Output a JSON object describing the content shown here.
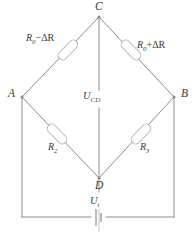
{
  "diagram": {
    "type": "wheatstone-bridge-circuit",
    "nodes": [
      {
        "id": "C",
        "label": "C",
        "position": "top"
      },
      {
        "id": "A",
        "label": "A",
        "position": "left"
      },
      {
        "id": "B",
        "label": "B",
        "position": "right"
      },
      {
        "id": "D",
        "label": "D",
        "position": "bottom"
      }
    ],
    "resistors": [
      {
        "id": "r-ac",
        "label_main": "R",
        "label_sub": "0",
        "label_tail": "−ΔR",
        "branch": "A-C"
      },
      {
        "id": "r-cb",
        "label_main": "R",
        "label_sub": "0",
        "label_tail": "+ΔR",
        "branch": "C-B"
      },
      {
        "id": "r-ad",
        "label_main": "R",
        "label_sub": "2",
        "label_tail": "",
        "branch": "A-D"
      },
      {
        "id": "r-db",
        "label_main": "R",
        "label_sub": "3",
        "label_tail": "",
        "branch": "D-B"
      }
    ],
    "voltages": [
      {
        "id": "u-cd",
        "label_main": "U",
        "label_sub": "CD",
        "branch": "C-D"
      },
      {
        "id": "u-i",
        "label_main": "U",
        "label_sub": "i",
        "branch": "supply"
      }
    ],
    "source": {
      "id": "battery",
      "symbol": "battery-cell"
    },
    "colors": {
      "wire": "#8c8c8c",
      "resistor_outline": "#b4b4b4",
      "text": "#3a3a3a",
      "background": "#ffffff"
    }
  }
}
